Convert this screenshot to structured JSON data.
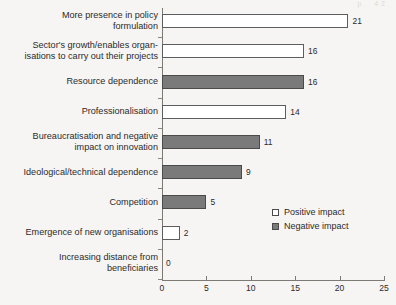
{
  "page_artifact": "p. 42",
  "chart_data": {
    "type": "bar",
    "orientation": "horizontal",
    "title": "",
    "subtitle": "",
    "xlabel": "",
    "ylabel": "",
    "xlim": [
      0,
      25
    ],
    "xticks": [
      0,
      5,
      10,
      15,
      20,
      25
    ],
    "xtick_labels": [
      "0",
      "5",
      "10",
      "15",
      "20",
      "25"
    ],
    "grid": false,
    "legend_position": "middle-right",
    "legend": [
      {
        "name": "Positive impact",
        "color": "#ffffff",
        "key": "positive"
      },
      {
        "name": "Negative impact",
        "color": "#7a7a7a",
        "key": "negative"
      }
    ],
    "categories": [
      "More presence in policy\nformulation",
      "Sector's growth/enables organ-\nisations to carry out their projects",
      "Resource dependence",
      "Professionalisation",
      "Bureaucratisation and negative\nimpact on innovation",
      "Ideological/technical dependence",
      "Competition",
      "Emergence of new organisations",
      "Increasing distance from\nbeneficiaries"
    ],
    "values": [
      21,
      16,
      16,
      14,
      11,
      9,
      5,
      2,
      0
    ],
    "value_labels": [
      "21",
      "16",
      "16",
      "14",
      "11",
      "9",
      "5",
      "2",
      "0"
    ],
    "impact_types": [
      "positive",
      "positive",
      "negative",
      "positive",
      "negative",
      "negative",
      "negative",
      "positive",
      "positive"
    ]
  },
  "colors": {
    "positive_fill": "#ffffff",
    "negative_fill": "#7a7a7a",
    "bar_stroke": "#5d5d5d",
    "axis": "#7d7a76",
    "background": "#f6f5f3",
    "text": "#2b2b2b"
  }
}
